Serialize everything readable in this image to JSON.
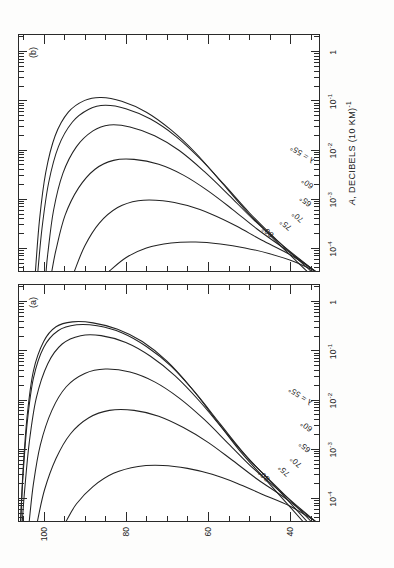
{
  "figure": {
    "orientation_note": "rotated-90",
    "axis_x_title": "A, DECIBELS (10 KM)",
    "axis_x_title_exp": "-1",
    "axis_y_title": "HEIGHT, KILOMETERS",
    "x_ticks": [
      {
        "value": -4,
        "label": "10",
        "exp": "-4"
      },
      {
        "value": -3,
        "label": "10",
        "exp": "-3"
      },
      {
        "value": -2,
        "label": "10",
        "exp": "-2"
      },
      {
        "value": -1,
        "label": "10",
        "exp": "-1"
      },
      {
        "value": 0,
        "label": "1",
        "exp": ""
      }
    ],
    "y_ticks": [
      40,
      60,
      80,
      100
    ],
    "y_minor_step": 5,
    "xlim": [
      -4.45,
      0.35
    ],
    "ylim": [
      33,
      106
    ]
  },
  "panels": [
    {
      "id": "a",
      "tag": "(a)"
    },
    {
      "id": "b",
      "tag": "(b)"
    }
  ],
  "curve_labels": {
    "l80": "80°",
    "l75": "75°",
    "l70": "70°",
    "l65": "65°",
    "l60": "60°",
    "l55": "λ = 55°"
  },
  "chart_data": {
    "type": "line",
    "title": "",
    "xlabel": "A, DECIBELS (10 KM)^-1",
    "ylabel": "HEIGHT, KILOMETERS",
    "xlim": [
      -4.45,
      0.35
    ],
    "ylim": [
      33,
      106
    ],
    "xscale": "log10",
    "xtick_labels": [
      "10^-4",
      "10^-3",
      "10^-2",
      "10^-1",
      "1"
    ],
    "ytick_labels": [
      "40",
      "60",
      "80",
      "100"
    ],
    "grid": false,
    "legend": "inline curve labels",
    "annotations": [
      "(a)",
      "(b)",
      "80°",
      "75°",
      "70°",
      "65°",
      "60°",
      "λ = 55°"
    ],
    "panels": [
      {
        "panel": "a",
        "series": [
          {
            "name": "80°",
            "points": [
              [
                -4.45,
                37
              ],
              [
                -3.7,
                45
              ],
              [
                -3.05,
                52
              ],
              [
                -2.4,
                58
              ],
              [
                -1.75,
                64
              ],
              [
                -1.2,
                70
              ],
              [
                -0.8,
                76
              ],
              [
                -0.55,
                82
              ],
              [
                -0.42,
                88
              ],
              [
                -0.4,
                93
              ],
              [
                -0.5,
                97
              ],
              [
                -0.8,
                100
              ],
              [
                -1.4,
                102.5
              ],
              [
                -2.3,
                104
              ],
              [
                -3.4,
                105
              ],
              [
                -4.45,
                105.6
              ]
            ]
          },
          {
            "name": "75°",
            "points": [
              [
                -4.45,
                36
              ],
              [
                -3.72,
                44
              ],
              [
                -3.1,
                51
              ],
              [
                -2.48,
                57
              ],
              [
                -1.85,
                63
              ],
              [
                -1.3,
                69
              ],
              [
                -0.9,
                75
              ],
              [
                -0.62,
                81
              ],
              [
                -0.48,
                87
              ],
              [
                -0.46,
                92
              ],
              [
                -0.58,
                96.5
              ],
              [
                -0.92,
                100
              ],
              [
                -1.55,
                102.5
              ],
              [
                -2.45,
                104
              ],
              [
                -3.5,
                105
              ],
              [
                -4.45,
                105.6
              ]
            ]
          },
          {
            "name": "70°",
            "points": [
              [
                -4.45,
                35
              ],
              [
                -3.78,
                43
              ],
              [
                -3.2,
                50
              ],
              [
                -2.62,
                56
              ],
              [
                -2.02,
                62
              ],
              [
                -1.5,
                68
              ],
              [
                -1.1,
                74
              ],
              [
                -0.82,
                80
              ],
              [
                -0.68,
                86
              ],
              [
                -0.68,
                91
              ],
              [
                -0.85,
                95.5
              ],
              [
                -1.25,
                99
              ],
              [
                -1.95,
                101.8
              ],
              [
                -2.85,
                103.5
              ],
              [
                -3.8,
                104.6
              ],
              [
                -4.45,
                105.2
              ]
            ]
          },
          {
            "name": "65°",
            "points": [
              [
                -4.45,
                34
              ],
              [
                -3.88,
                42
              ],
              [
                -3.38,
                49
              ],
              [
                -2.88,
                55
              ],
              [
                -2.38,
                61
              ],
              [
                -1.95,
                67
              ],
              [
                -1.62,
                73
              ],
              [
                -1.42,
                79
              ],
              [
                -1.36,
                85
              ],
              [
                -1.45,
                90
              ],
              [
                -1.72,
                94.5
              ],
              [
                -2.2,
                98
              ],
              [
                -2.9,
                100.8
              ],
              [
                -3.7,
                102.5
              ],
              [
                -4.45,
                103.5
              ]
            ]
          },
          {
            "name": "60°",
            "points": [
              [
                -4.45,
                34
              ],
              [
                -4.0,
                41
              ],
              [
                -3.6,
                48
              ],
              [
                -3.22,
                54
              ],
              [
                -2.85,
                60
              ],
              [
                -2.55,
                66
              ],
              [
                -2.32,
                72
              ],
              [
                -2.2,
                78
              ],
              [
                -2.2,
                84
              ],
              [
                -2.35,
                89
              ],
              [
                -2.68,
                93.5
              ],
              [
                -3.18,
                97
              ],
              [
                -3.82,
                99.8
              ],
              [
                -4.45,
                101.5
              ]
            ]
          },
          {
            "name": "λ = 55°",
            "points": [
              [
                -4.45,
                34
              ],
              [
                -4.15,
                40
              ],
              [
                -3.9,
                47
              ],
              [
                -3.68,
                53
              ],
              [
                -3.5,
                59
              ],
              [
                -3.38,
                65
              ],
              [
                -3.32,
                71
              ],
              [
                -3.34,
                77
              ],
              [
                -3.48,
                83
              ],
              [
                -3.75,
                88
              ],
              [
                -4.1,
                92
              ],
              [
                -4.45,
                94.5
              ]
            ]
          }
        ]
      },
      {
        "panel": "b",
        "series": [
          {
            "name": "80°",
            "points": [
              [
                -4.45,
                36
              ],
              [
                -3.8,
                44
              ],
              [
                -3.2,
                51
              ],
              [
                -2.62,
                57
              ],
              [
                -2.05,
                63
              ],
              [
                -1.58,
                69
              ],
              [
                -1.22,
                75
              ],
              [
                -1.0,
                81
              ],
              [
                -0.92,
                86
              ],
              [
                -0.98,
                90
              ],
              [
                -1.22,
                94
              ],
              [
                -1.7,
                97.2
              ],
              [
                -2.45,
                99.5
              ],
              [
                -3.4,
                101
              ],
              [
                -4.45,
                102
              ]
            ]
          },
          {
            "name": "75°",
            "points": [
              [
                -4.45,
                35
              ],
              [
                -3.84,
                43
              ],
              [
                -3.26,
                50
              ],
              [
                -2.7,
                56
              ],
              [
                -2.16,
                62
              ],
              [
                -1.7,
                68
              ],
              [
                -1.36,
                74
              ],
              [
                -1.15,
                80
              ],
              [
                -1.08,
                85
              ],
              [
                -1.16,
                89
              ],
              [
                -1.42,
                93
              ],
              [
                -1.92,
                96.4
              ],
              [
                -2.66,
                98.8
              ],
              [
                -3.58,
                100.4
              ],
              [
                -4.45,
                101.4
              ]
            ]
          },
          {
            "name": "70°",
            "points": [
              [
                -4.45,
                34
              ],
              [
                -3.92,
                42
              ],
              [
                -3.4,
                49
              ],
              [
                -2.9,
                55
              ],
              [
                -2.42,
                61
              ],
              [
                -2.0,
                67
              ],
              [
                -1.7,
                73
              ],
              [
                -1.52,
                79
              ],
              [
                -1.48,
                84
              ],
              [
                -1.6,
                88
              ],
              [
                -1.92,
                92
              ],
              [
                -2.46,
                95.3
              ],
              [
                -3.22,
                97.6
              ],
              [
                -4.1,
                99
              ],
              [
                -4.45,
                99.4
              ]
            ]
          },
          {
            "name": "65°",
            "points": [
              [
                -4.45,
                34
              ],
              [
                -4.02,
                41
              ],
              [
                -3.6,
                48
              ],
              [
                -3.2,
                54
              ],
              [
                -2.82,
                60
              ],
              [
                -2.5,
                66
              ],
              [
                -2.28,
                72
              ],
              [
                -2.18,
                78
              ],
              [
                -2.2,
                83
              ],
              [
                -2.38,
                87.5
              ],
              [
                -2.76,
                91.5
              ],
              [
                -3.32,
                94.8
              ],
              [
                -4.02,
                97
              ],
              [
                -4.45,
                98
              ]
            ]
          },
          {
            "name": "60°",
            "points": [
              [
                -4.45,
                34
              ],
              [
                -4.12,
                40
              ],
              [
                -3.82,
                47
              ],
              [
                -3.54,
                53
              ],
              [
                -3.3,
                59
              ],
              [
                -3.12,
                65
              ],
              [
                -3.02,
                71
              ],
              [
                -3.02,
                77
              ],
              [
                -3.16,
                82
              ],
              [
                -3.48,
                86.5
              ],
              [
                -3.94,
                90
              ],
              [
                -4.45,
                92.5
              ]
            ]
          },
          {
            "name": "λ = 55°",
            "points": [
              [
                -4.45,
                34
              ],
              [
                -4.26,
                39
              ],
              [
                -4.1,
                45
              ],
              [
                -3.98,
                51
              ],
              [
                -3.9,
                57
              ],
              [
                -3.86,
                63
              ],
              [
                -3.88,
                69
              ],
              [
                -3.98,
                75
              ],
              [
                -4.18,
                80
              ],
              [
                -4.45,
                84
              ]
            ]
          }
        ]
      }
    ]
  }
}
